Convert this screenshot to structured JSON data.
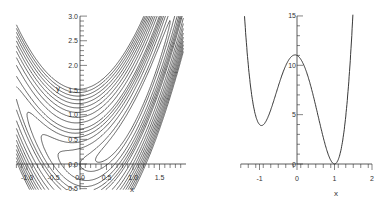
{
  "chart_data": [
    {
      "type": "contour",
      "title": "",
      "function": "10*(y - x^2)^2 + (1 - x)^2",
      "xlabel": "x",
      "ylabel": "y",
      "xlim": [
        -1.2,
        2.0
      ],
      "ylim": [
        -0.5,
        3.0
      ],
      "x_ticks": [
        "-1.0",
        "-0.5",
        "0.0",
        "0.5",
        "1.0",
        "1.5"
      ],
      "y_ticks": [
        "-0.5",
        "0.0",
        "0.5",
        "1.0",
        "1.5",
        "2.0",
        "2.5",
        "3.0"
      ],
      "levels": [
        0.5,
        1,
        2,
        3,
        4,
        5,
        6,
        8,
        10,
        12,
        14,
        16,
        18,
        20,
        22,
        24
      ],
      "grid": false,
      "legend": "none"
    },
    {
      "type": "line",
      "title": "",
      "function": "10*(x^2 - 1)^2 + (1 - x)^2",
      "xlabel": "x",
      "ylabel": "",
      "xlim": [
        -1.5,
        2.0
      ],
      "ylim": [
        0,
        15
      ],
      "x_ticks": [
        "-1",
        "0",
        "1",
        "2"
      ],
      "y_ticks": [
        "0",
        "5",
        "10",
        "15"
      ],
      "key_points": [
        {
          "x": -1,
          "y": 4,
          "label": "local min"
        },
        {
          "x": 0,
          "y": 11,
          "label": "local max"
        },
        {
          "x": 1,
          "y": 0,
          "label": "global min"
        }
      ],
      "grid": false,
      "legend": "none"
    }
  ],
  "labels": {
    "left_x": "x",
    "left_y": "y",
    "right_x": "x"
  }
}
